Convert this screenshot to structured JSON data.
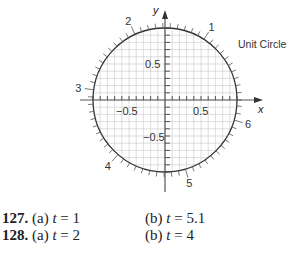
{
  "chart_data": {
    "type": "scatter",
    "title": "Unit Circle",
    "xlabel": "x",
    "ylabel": "y",
    "xlim": [
      -1,
      1
    ],
    "ylim": [
      -1,
      1
    ],
    "grid": true,
    "grid_step": 0.1,
    "x_tick_labels": [
      "-0.5",
      "0.5"
    ],
    "y_tick_labels": [
      "0.5",
      "-0.5"
    ],
    "tick_mark_step_radians": 0.1,
    "angle_labels": [
      {
        "label": "1",
        "t": 1
      },
      {
        "label": "2",
        "t": 2
      },
      {
        "label": "3",
        "t": 3
      },
      {
        "label": "4",
        "t": 4
      },
      {
        "label": "5",
        "t": 5
      },
      {
        "label": "6",
        "t": 6
      }
    ],
    "series": [
      {
        "name": "unit circle",
        "equation": "x^2 + y^2 = 1"
      }
    ]
  },
  "figure": {
    "title_label": "Unit Circle",
    "x_axis_label": "x",
    "y_axis_label": "y",
    "x_tick_neg": "−0.5",
    "x_tick_pos": "0.5",
    "y_tick_pos": "0.5",
    "y_tick_neg": "−0.5",
    "colors": {
      "grid": "#c8c8c8",
      "axis": "#333333",
      "circle": "#333333",
      "text": "#222222"
    }
  },
  "exercises": [
    {
      "number": "127.",
      "part_a_label": "(a)",
      "part_a_var": "t",
      "part_a_value": "= 1",
      "part_b_label": "(b)",
      "part_b_var": "t",
      "part_b_value": "= 5.1"
    },
    {
      "number": "128.",
      "part_a_label": "(a)",
      "part_a_var": "t",
      "part_a_value": "= 2",
      "part_b_label": "(b)",
      "part_b_var": "t",
      "part_b_value": "= 4"
    }
  ]
}
